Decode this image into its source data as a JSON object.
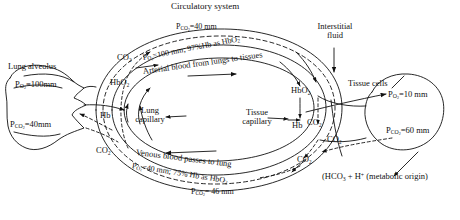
{
  "figure": {
    "title": "Circulatory system",
    "type": "physiology-diagram"
  },
  "labels": {
    "circulatory_system": "Circulatory system",
    "interstitial_fluid_line1": "Interstitial",
    "interstitial_fluid_line2": "fluid",
    "lung_alveolus": "Lung alveolus",
    "tissue_cells": "Tissue cells",
    "lung_capillary_line1": "Lung",
    "lung_capillary_line2": "capillary",
    "tissue_capillary_line1": "Tissue",
    "tissue_capillary_line2": "capillary",
    "arterial_blood": "Arterial blood from lungs to tissues",
    "venous_blood": "Venous blood passes to lung",
    "metabolic_origin": "(HCO₃ + H⁺ (metabolic origin)"
  },
  "values": {
    "alveolus_po2": "P",
    "alveolus_po2_sub": "O",
    "alveolus_po2_sub2": "2",
    "alveolus_po2_val": "=100mm",
    "alveolus_pco2_val": "=40mm",
    "top_pco2_val": "=40 mm",
    "bottom_pco2_val": "= 46 mm",
    "arterial_po2_val": "=100 mm; 97%Hb as HbO",
    "venous_po2_val": "=40 mm; 75% Hb as HbO",
    "tissue_po2_val": "=10 mm",
    "tissue_pco2_val": "=60 mm"
  },
  "species": {
    "co2": "CO",
    "hbo2": "HbO",
    "hb": "Hb",
    "two": "2"
  },
  "markers": {
    "co2_alveolus": "CO₂",
    "co2_lung_capillary": "CO₂",
    "hbo2_lung": "HbO₂",
    "hb_lung": "Hb",
    "hbo2_tissue": "HbO₂",
    "hb_tissue": "Hb",
    "co2_tissue_cap": "CO₂",
    "co2_interstitial": "CO₂",
    "co2_lower_tissue": "CO₂"
  },
  "colors": {
    "ink": "#111111",
    "paper": "#ffffff"
  }
}
